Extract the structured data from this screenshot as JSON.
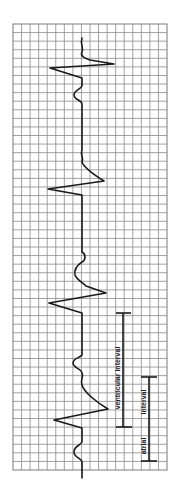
{
  "diagram": {
    "grid": {
      "columns": 18,
      "rows": 52,
      "line_color": "#8a8a8a"
    },
    "trace": {
      "color": "#1a1a1a",
      "complex_count": 4
    },
    "intervals": [
      {
        "id": "ventricular",
        "label": "ventricular interval"
      },
      {
        "id": "atrial",
        "label_part1": "atrial",
        "label_part2": "interval"
      }
    ]
  }
}
